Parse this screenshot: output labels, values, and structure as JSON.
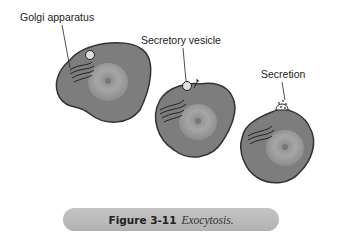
{
  "labels": {
    "golgi": "Golgi apparatus",
    "vesicle": "Secretory vesicle",
    "secretion": "Secretion"
  },
  "caption": {
    "number": "Figure 3-11",
    "title": "Exocytosis."
  },
  "colors": {
    "cell_fill": "#7f7f7f",
    "cell_outline": "#3a3a3a",
    "nucleus": "#9a9a9a",
    "caption_bg": "#bbbbbb"
  },
  "cells": [
    {
      "name": "cell-golgi",
      "stage": 1
    },
    {
      "name": "cell-vesicle",
      "stage": 2
    },
    {
      "name": "cell-secretion",
      "stage": 3
    }
  ]
}
